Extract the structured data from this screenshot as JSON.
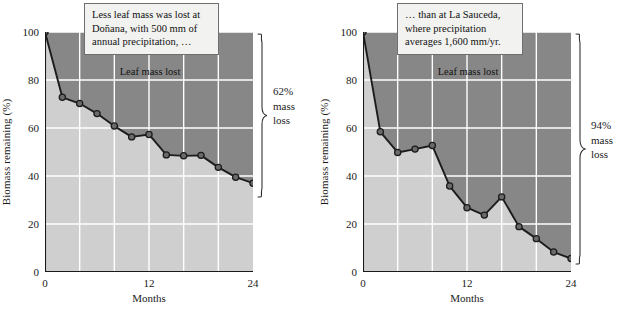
{
  "figure": {
    "panels": [
      {
        "id": "donana",
        "callout": {
          "name": "callout-donana",
          "lines": [
            "Less leaf mass was lost at",
            "Doñana, with 500 mm of",
            "annual precipitation, …"
          ]
        },
        "inplot_note": "Leaf mass lost",
        "brace_label": [
          "62%",
          "mass",
          "loss"
        ],
        "chart": {
          "type": "line",
          "title": "",
          "xlabel": "Months",
          "ylabel": "Biomass remaining (%)",
          "xlim": [
            0,
            24
          ],
          "ylim": [
            0,
            100
          ],
          "xticks": [
            0,
            12,
            24
          ],
          "xtick_labels": [
            "0",
            "12",
            "24"
          ],
          "xminor_step": 2,
          "yticks": [
            0,
            20,
            40,
            60,
            80,
            100
          ],
          "ytick_labels": [
            "0",
            "20",
            "40",
            "60",
            "80",
            "100"
          ],
          "grid": true,
          "series": [
            {
              "name": "Doñana biomass remaining",
              "x": [
                0,
                2,
                4,
                6,
                8,
                10,
                12,
                14,
                16,
                18,
                20,
                22,
                24
              ],
              "y": [
                100,
                72.8,
                70.2,
                66.0,
                60.8,
                56.3,
                57.3,
                48.8,
                48.4,
                48.6,
                43.6,
                39.5,
                37.0
              ]
            }
          ],
          "fill_above_label": "Leaf mass lost",
          "colors": {
            "area_above": "#878787",
            "area_below": "#cfcfcf",
            "grid": "#ffffff",
            "line": "#1c1c1c",
            "marker": "#6a6a6a",
            "marker_edge": "#1c1c1c"
          }
        }
      },
      {
        "id": "la-sauceda",
        "callout": {
          "name": "callout-la-sauceda",
          "lines": [
            "… than at La Sauceda,",
            "where precipitation",
            "averages 1,600 mm/yr."
          ]
        },
        "inplot_note": "Leaf mass lost",
        "brace_label": [
          "94%",
          "mass",
          "loss"
        ],
        "chart": {
          "type": "line",
          "title": "",
          "xlabel": "Months",
          "ylabel": "Biomass remaining (%)",
          "xlim": [
            0,
            24
          ],
          "ylim": [
            0,
            100
          ],
          "xticks": [
            0,
            12,
            24
          ],
          "xtick_labels": [
            "0",
            "12",
            "24"
          ],
          "xminor_step": 2,
          "yticks": [
            0,
            20,
            40,
            60,
            80,
            100
          ],
          "ytick_labels": [
            "0",
            "20",
            "40",
            "60",
            "80",
            "100"
          ],
          "grid": true,
          "series": [
            {
              "name": "La Sauceda biomass remaining",
              "x": [
                0,
                2,
                4,
                6,
                8,
                10,
                12,
                14,
                16,
                18,
                20,
                22,
                24
              ],
              "y": [
                100,
                58.4,
                49.8,
                51.2,
                52.7,
                35.8,
                26.8,
                23.7,
                31.3,
                18.9,
                13.9,
                8.3,
                5.6
              ]
            }
          ],
          "fill_above_label": "Leaf mass lost",
          "colors": {
            "area_above": "#878787",
            "area_below": "#cfcfcf",
            "grid": "#ffffff",
            "line": "#1c1c1c",
            "marker": "#6a6a6a",
            "marker_edge": "#1c1c1c"
          }
        }
      }
    ]
  },
  "chart_data": [
    {
      "type": "line",
      "title": "Doñana — 500 mm annual precipitation",
      "xlabel": "Months",
      "ylabel": "Biomass remaining (%)",
      "xlim": [
        0,
        24
      ],
      "ylim": [
        0,
        100
      ],
      "xticks": [
        0,
        12,
        24
      ],
      "yticks": [
        0,
        20,
        40,
        60,
        80,
        100
      ],
      "grid": true,
      "legend": "none",
      "x": [
        0,
        2,
        4,
        6,
        8,
        10,
        12,
        14,
        16,
        18,
        20,
        22,
        24
      ],
      "series": [
        {
          "name": "Biomass remaining",
          "values": [
            100,
            72.8,
            70.2,
            66.0,
            60.8,
            56.3,
            57.3,
            48.8,
            48.4,
            48.6,
            43.6,
            39.5,
            37.0
          ]
        }
      ],
      "annotations": [
        "Less leaf mass was lost at Doñana, with 500 mm of annual precipitation, …",
        "Leaf mass lost",
        "62% mass loss"
      ]
    },
    {
      "type": "line",
      "title": "La Sauceda — 1,600 mm annual precipitation",
      "xlabel": "Months",
      "ylabel": "Biomass remaining (%)",
      "xlim": [
        0,
        24
      ],
      "ylim": [
        0,
        100
      ],
      "xticks": [
        0,
        12,
        24
      ],
      "yticks": [
        0,
        20,
        40,
        60,
        80,
        100
      ],
      "grid": true,
      "legend": "none",
      "x": [
        0,
        2,
        4,
        6,
        8,
        10,
        12,
        14,
        16,
        18,
        20,
        22,
        24
      ],
      "series": [
        {
          "name": "Biomass remaining",
          "values": [
            100,
            58.4,
            49.8,
            51.2,
            52.7,
            35.8,
            26.8,
            23.7,
            31.3,
            18.9,
            13.9,
            8.3,
            5.6
          ]
        }
      ],
      "annotations": [
        "… than at La Sauceda, where precipitation averages 1,600 mm/yr.",
        "Leaf mass lost",
        "94% mass loss"
      ]
    }
  ]
}
